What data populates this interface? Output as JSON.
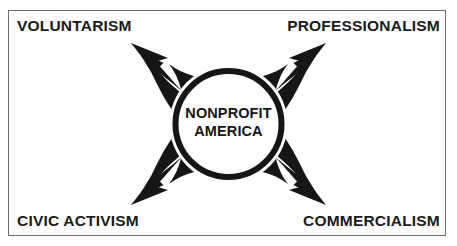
{
  "figure": {
    "type": "conceptual-diagram",
    "shape": "four-way radiating arrows from central circle",
    "border_color": "#6f7072",
    "fill_color": "#161616",
    "background_color": "#ffffff"
  },
  "center": {
    "line1": "NONPROFIT",
    "line2": "AMERICA"
  },
  "corners": {
    "top_left": "VOLUNTARISM",
    "top_right": "PROFESSIONALISM",
    "bottom_left": "CIVIC ACTIVISM",
    "bottom_right": "COMMERCIALISM"
  },
  "arrows": [
    {
      "name": "arrow-top-left",
      "direction": "up-left",
      "target": "VOLUNTARISM"
    },
    {
      "name": "arrow-top-right",
      "direction": "up-right",
      "target": "PROFESSIONALISM"
    },
    {
      "name": "arrow-bottom-left",
      "direction": "down-left",
      "target": "CIVIC ACTIVISM"
    },
    {
      "name": "arrow-bottom-right",
      "direction": "down-right",
      "target": "COMMERCIALISM"
    }
  ]
}
